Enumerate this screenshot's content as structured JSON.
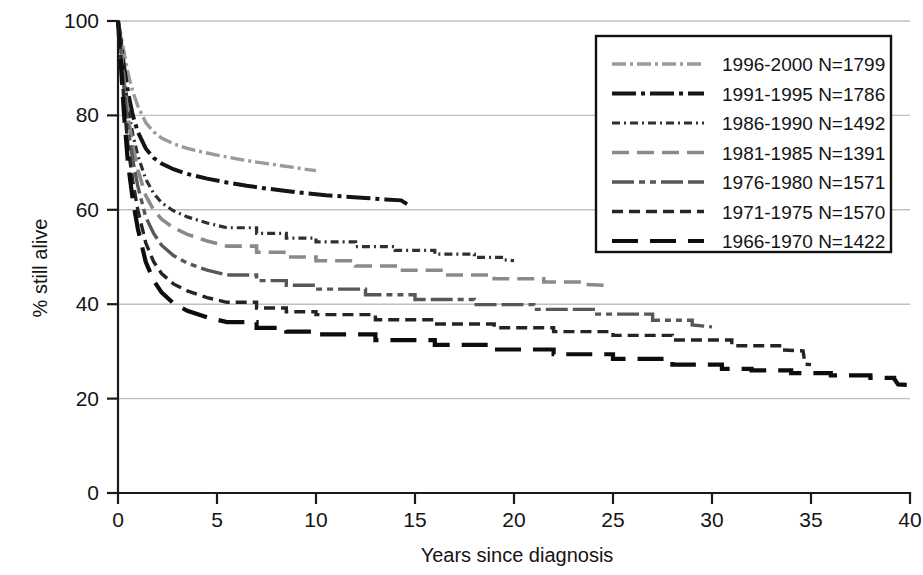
{
  "chart_data": {
    "type": "line",
    "title": "",
    "xlabel": "Years since diagnosis",
    "ylabel": "% still alive",
    "xlim": [
      0,
      40
    ],
    "ylim": [
      0,
      100
    ],
    "xticks": [
      "0",
      "5",
      "10",
      "15",
      "20",
      "25",
      "30",
      "35",
      "40"
    ],
    "yticks": [
      "0",
      "20",
      "40",
      "60",
      "80",
      "100"
    ],
    "xtick_values": [
      0,
      5,
      10,
      15,
      20,
      25,
      30,
      35,
      40
    ],
    "ytick_values": [
      0,
      20,
      40,
      60,
      80,
      100
    ],
    "grid": "horizontal",
    "legend_position": "top-right",
    "series": [
      {
        "name": "1996-2000 N=1799",
        "period": "1996-2000",
        "n": 1799,
        "color": "#9a9a9a",
        "dash": "14,4,3,4,14,4,3,4",
        "width": 3.4,
        "x": [
          0,
          0.15,
          0.3,
          0.5,
          0.75,
          1.0,
          1.4,
          1.8,
          2.2,
          2.8,
          3.5,
          4.2,
          5.0,
          6.0,
          7.0,
          8.0,
          9.0,
          9.6,
          10.0
        ],
        "y": [
          100,
          97.0,
          93.5,
          89.0,
          85.0,
          82.0,
          78.5,
          76.5,
          75.2,
          74.0,
          73.0,
          72.3,
          71.6,
          70.8,
          70.1,
          69.5,
          68.9,
          68.5,
          68.3
        ]
      },
      {
        "name": "1991-1995 N=1786",
        "period": "1991-1995",
        "n": 1786,
        "color": "#151515",
        "dash": "24,5,4,5,24,5,4,5",
        "width": 4.0,
        "x": [
          0,
          0.15,
          0.3,
          0.5,
          0.75,
          1.0,
          1.4,
          1.8,
          2.2,
          2.8,
          3.5,
          4.5,
          5.5,
          6.5,
          7.5,
          8.5,
          9.5,
          10.5,
          11.5,
          12.5,
          13.5,
          14.3,
          14.6
        ],
        "y": [
          100,
          95.5,
          90.5,
          85.0,
          80.0,
          76.5,
          73.0,
          71.0,
          69.8,
          68.6,
          67.6,
          66.6,
          65.8,
          65.1,
          64.5,
          64.0,
          63.5,
          63.1,
          62.8,
          62.5,
          62.2,
          62.0,
          61.2
        ]
      },
      {
        "name": "1986-1990 N=1492",
        "period": "1986-1990",
        "n": 1492,
        "color": "#303030",
        "dash": "8,4,2,4,8,4,2,4",
        "width": 3.2,
        "x": [
          0,
          0.15,
          0.3,
          0.5,
          0.75,
          1.0,
          1.4,
          1.8,
          2.2,
          2.8,
          3.5,
          4.5,
          5.5,
          7.0,
          8.5,
          10.0,
          12.0,
          14.0,
          16.0,
          18.0,
          19.5,
          20.0
        ],
        "y": [
          100,
          95.0,
          89.0,
          82.0,
          76.0,
          71.5,
          66.5,
          63.5,
          61.5,
          59.8,
          58.5,
          57.2,
          56.2,
          55.0,
          54.0,
          53.2,
          52.2,
          51.4,
          50.6,
          49.9,
          49.4,
          49.2
        ]
      },
      {
        "name": "1981-1985 N=1391",
        "period": "1981-1985",
        "n": 1391,
        "color": "#8a8a8a",
        "dash": "17,8",
        "width": 3.6,
        "x": [
          0,
          0.15,
          0.3,
          0.5,
          0.75,
          1.0,
          1.4,
          1.8,
          2.2,
          2.8,
          3.5,
          4.5,
          5.5,
          7.0,
          8.5,
          10.0,
          12.0,
          14.0,
          16.5,
          19.0,
          21.5,
          23.5,
          24.6
        ],
        "y": [
          100,
          94.5,
          87.5,
          80.0,
          73.5,
          68.5,
          63.0,
          60.0,
          58.0,
          56.2,
          54.8,
          53.4,
          52.3,
          51.0,
          50.0,
          49.2,
          48.1,
          47.2,
          46.2,
          45.4,
          44.7,
          44.2,
          44.0
        ]
      },
      {
        "name": "1976-1980 N=1571",
        "period": "1976-1980",
        "n": 1571,
        "color": "#575757",
        "dash": "22,5,6,5,6,5,22,5",
        "width": 3.4,
        "x": [
          0,
          0.15,
          0.3,
          0.5,
          0.75,
          1.0,
          1.4,
          1.8,
          2.2,
          2.8,
          3.5,
          4.5,
          5.5,
          7.0,
          8.5,
          10.0,
          12.5,
          15.0,
          18.0,
          21.0,
          24.0,
          27.0,
          29.0,
          30.0
        ],
        "y": [
          100,
          93.5,
          86.0,
          77.5,
          70.5,
          65.0,
          58.5,
          55.0,
          52.5,
          50.3,
          48.7,
          47.2,
          46.2,
          45.0,
          44.0,
          43.2,
          42.0,
          41.0,
          39.9,
          38.9,
          37.9,
          36.6,
          35.6,
          35.2
        ]
      },
      {
        "name": "1971-1975 N=1570",
        "period": "1971-1975",
        "n": 1570,
        "color": "#242424",
        "dash": "11,6",
        "width": 3.4,
        "x": [
          0,
          0.15,
          0.3,
          0.5,
          0.75,
          1.0,
          1.4,
          1.8,
          2.2,
          2.8,
          3.5,
          4.5,
          5.5,
          7.0,
          8.5,
          10.0,
          13.0,
          16.0,
          19.0,
          22.0,
          25.0,
          28.0,
          31.0,
          33.5,
          34.6,
          34.7,
          35.0
        ],
        "y": [
          100,
          92.0,
          83.0,
          73.5,
          66.0,
          60.0,
          53.0,
          49.0,
          46.5,
          44.3,
          42.8,
          41.4,
          40.4,
          39.2,
          38.4,
          37.8,
          36.7,
          35.8,
          35.0,
          34.2,
          33.4,
          32.4,
          31.2,
          30.3,
          30.1,
          27.3,
          27.2
        ]
      },
      {
        "name": "1966-1970 N=1422",
        "period": "1966-1970",
        "n": 1422,
        "color": "#0d0d0d",
        "dash": "26,12",
        "width": 4.2,
        "x": [
          0,
          0.15,
          0.3,
          0.5,
          0.75,
          1.0,
          1.4,
          1.8,
          2.2,
          2.8,
          3.5,
          4.5,
          5.5,
          7.0,
          8.5,
          10.0,
          13.0,
          16.0,
          19.0,
          22.0,
          25.0,
          28.0,
          30.5,
          32.0,
          34.0,
          36.0,
          38.0,
          39.2,
          39.4,
          40.0
        ],
        "y": [
          100,
          90.5,
          80.5,
          70.0,
          62.0,
          56.0,
          49.0,
          45.0,
          42.5,
          40.2,
          38.6,
          37.2,
          36.2,
          35.0,
          34.2,
          33.6,
          32.4,
          31.4,
          30.4,
          29.4,
          28.4,
          27.2,
          26.3,
          26.0,
          25.4,
          24.9,
          24.4,
          24.2,
          23.0,
          22.9
        ]
      }
    ]
  },
  "legend": {
    "items": [
      {
        "label": "1996-2000 N=1799"
      },
      {
        "label": "1991-1995 N=1786"
      },
      {
        "label": "1986-1990 N=1492"
      },
      {
        "label": "1981-1985 N=1391"
      },
      {
        "label": "1976-1980 N=1571"
      },
      {
        "label": "1971-1975 N=1570"
      },
      {
        "label": "1966-1970 N=1422"
      }
    ]
  }
}
